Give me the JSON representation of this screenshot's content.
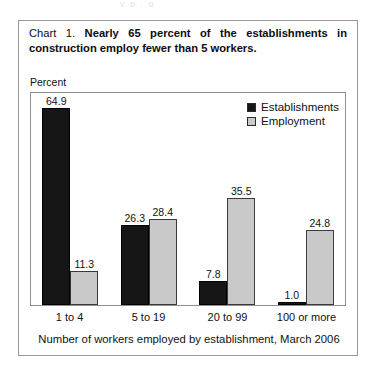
{
  "scan_remnant": "y p , g",
  "caption": {
    "lead": "Chart 1.",
    "bold": "Nearly 65 percent of the establishments in construction employ fewer than 5 workers."
  },
  "footer": "Number of workers employed by establishment, March 2006",
  "legend": {
    "items": [
      {
        "label": "Establishments",
        "color": "#161616"
      },
      {
        "label": "Employment",
        "color": "#c9c9c9"
      }
    ]
  },
  "chart_data": {
    "type": "bar",
    "title": "Nearly 65 percent of the establishments in construction employ fewer than 5 workers.",
    "categories": [
      "1 to 4",
      "5 to 19",
      "20 to 99",
      "100 or more"
    ],
    "series": [
      {
        "name": "Establishments",
        "values": [
          64.9,
          26.3,
          7.8,
          1.0
        ],
        "color": "#161616"
      },
      {
        "name": "Employment",
        "values": [
          11.3,
          28.4,
          35.5,
          24.8
        ],
        "color": "#c9c9c9"
      }
    ],
    "xlabel": "Number of workers employed by establishment, March 2006",
    "ylabel": "Percent",
    "ylim": [
      0,
      70
    ],
    "grid": false,
    "legend_position": "top-right",
    "value_labels": true
  }
}
